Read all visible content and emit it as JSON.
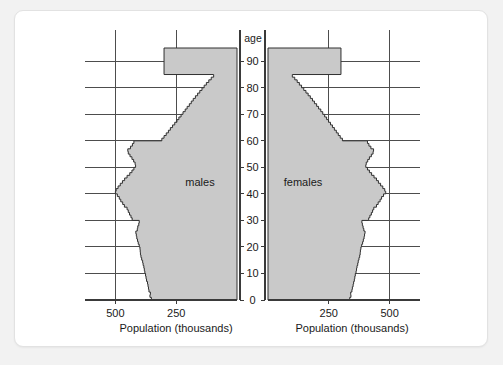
{
  "card": {
    "background": "#ffffff",
    "border_color": "#e2e2e2"
  },
  "page_background": "#f2f2f2",
  "chart_data": {
    "type": "bar",
    "orientation": "horizontal",
    "subtype": "population-pyramid",
    "title": "",
    "xlabel": "Population (thousands)",
    "ylabel": "age",
    "age_axis_title": "age",
    "panels": [
      {
        "name": "males",
        "label": "males",
        "side": "left"
      },
      {
        "name": "females",
        "label": "females",
        "side": "right"
      }
    ],
    "x_tick_labels_left": [
      "500",
      "250"
    ],
    "x_tick_values_left": [
      500,
      250
    ],
    "x_tick_labels_right": [
      "250",
      "500"
    ],
    "x_tick_values_right": [
      250,
      500
    ],
    "xlim": [
      0,
      625
    ],
    "ylim": [
      0,
      95
    ],
    "y_tick_labels": [
      "0",
      "10",
      "20",
      "30",
      "40",
      "50",
      "60",
      "70",
      "80",
      "90"
    ],
    "y_tick_values": [
      0,
      10,
      20,
      30,
      40,
      50,
      60,
      70,
      80,
      90
    ],
    "grid": true,
    "grid_x_values": [
      250,
      500
    ],
    "grid_y_values": [
      10,
      20,
      30,
      40,
      50,
      60,
      70,
      80,
      90
    ],
    "legend_position": "inside-panels",
    "fill_color": "#c9c9c9",
    "outline_color": "#303030",
    "ages": [
      0,
      1,
      2,
      3,
      4,
      5,
      6,
      7,
      8,
      9,
      10,
      11,
      12,
      13,
      14,
      15,
      16,
      17,
      18,
      19,
      20,
      21,
      22,
      23,
      24,
      25,
      26,
      27,
      28,
      29,
      30,
      31,
      32,
      33,
      34,
      35,
      36,
      37,
      38,
      39,
      40,
      41,
      42,
      43,
      44,
      45,
      46,
      47,
      48,
      49,
      50,
      51,
      52,
      53,
      54,
      55,
      56,
      57,
      58,
      59,
      60,
      61,
      62,
      63,
      64,
      65,
      66,
      67,
      68,
      69,
      70,
      71,
      72,
      73,
      74,
      75,
      76,
      77,
      78,
      79,
      80,
      81,
      82,
      83,
      84,
      85
    ],
    "series": [
      {
        "name": "males",
        "values": [
          352,
          358,
          356,
          362,
          364,
          366,
          368,
          372,
          374,
          376,
          379,
          381,
          383,
          386,
          388,
          392,
          395,
          397,
          398,
          399,
          402,
          406,
          409,
          412,
          414,
          416,
          410,
          408,
          404,
          402,
          431,
          436,
          442,
          447,
          452,
          463,
          470,
          478,
          484,
          492,
          500,
          497,
          489,
          480,
          471,
          462,
          452,
          441,
          432,
          424,
          417,
          419,
          425,
          432,
          440,
          447,
          449,
          438,
          430,
          424,
          309,
          300,
          291,
          282,
          274,
          265,
          256,
          247,
          239,
          230,
          222,
          213,
          205,
          196,
          188,
          180,
          171,
          162,
          153,
          144,
          135,
          126,
          116,
          106,
          96,
          300
        ]
      },
      {
        "name": "females",
        "values": [
          336,
          341,
          340,
          345,
          347,
          350,
          352,
          355,
          357,
          359,
          362,
          364,
          366,
          369,
          371,
          374,
          377,
          379,
          380,
          382,
          385,
          389,
          392,
          395,
          397,
          399,
          394,
          391,
          388,
          386,
          414,
          419,
          425,
          430,
          435,
          446,
          453,
          461,
          467,
          475,
          484,
          480,
          472,
          463,
          454,
          446,
          436,
          426,
          417,
          409,
          402,
          404,
          410,
          417,
          425,
          432,
          434,
          423,
          415,
          409,
          306,
          297,
          289,
          281,
          273,
          265,
          257,
          249,
          241,
          233,
          225,
          217,
          208,
          200,
          191,
          183,
          174,
          165,
          156,
          147,
          138,
          129,
          120,
          110,
          100,
          300
        ]
      }
    ]
  }
}
